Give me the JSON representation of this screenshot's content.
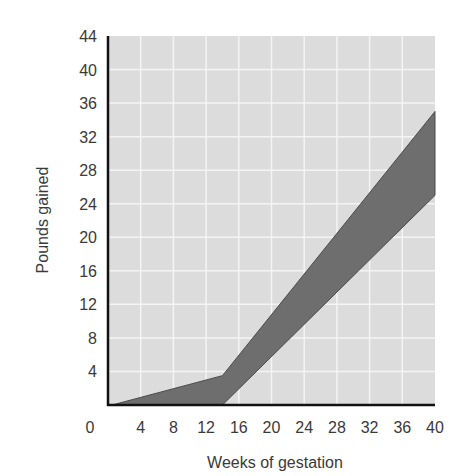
{
  "chart_data": {
    "type": "area",
    "title": "",
    "xlabel": "Weeks of gestation",
    "ylabel": "Pounds gained",
    "xlim": [
      0,
      40
    ],
    "ylim": [
      0,
      44
    ],
    "x_ticks": [
      0,
      4,
      8,
      12,
      16,
      20,
      24,
      28,
      32,
      36,
      40
    ],
    "y_ticks": [
      4,
      8,
      12,
      16,
      20,
      24,
      28,
      32,
      36,
      40,
      44
    ],
    "x_tick_labels": [
      "0",
      "4",
      "8",
      "12",
      "16",
      "20",
      "24",
      "28",
      "32",
      "36",
      "40"
    ],
    "y_tick_labels": [
      "4",
      "8",
      "12",
      "16",
      "20",
      "24",
      "28",
      "32",
      "36",
      "40",
      "44"
    ],
    "grid": true,
    "legend": null,
    "series": [
      {
        "name": "Upper bound of recommended weight gain",
        "x": [
          0.5,
          14,
          40
        ],
        "y": [
          0,
          3.5,
          35
        ]
      },
      {
        "name": "Lower bound of recommended weight gain",
        "x": [
          0.5,
          14,
          40
        ],
        "y": [
          0,
          0,
          25
        ]
      }
    ],
    "band": "Shaded region between upper and lower bounds"
  },
  "colors": {
    "plot_background": "#dcdcdc",
    "grid": "#f4f4f4",
    "band_fill": "#6e6e6e",
    "band_stroke": "#4a4a4a",
    "axis": "#111111"
  }
}
